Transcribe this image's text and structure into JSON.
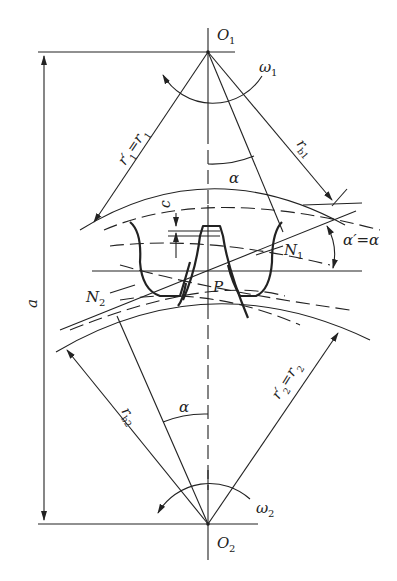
{
  "diagram": {
    "type": "gear-mesh-geometry",
    "labels": {
      "center_top": "O",
      "center_top_sub": "1",
      "center_bottom": "O",
      "center_bottom_sub": "2",
      "omega1": "ω",
      "omega1_sub": "1",
      "omega2": "ω",
      "omega2_sub": "2",
      "pitch_point": "P",
      "center_distance": "a",
      "clearance": "c",
      "n1": "N",
      "n1_sub": "1",
      "n2": "N",
      "n2_sub": "2",
      "alpha_top": "α",
      "alpha_bottom": "α",
      "pressure_angle": "α′=α",
      "r1": "r′",
      "r1_sub": "1",
      "r1_eq": "=r",
      "r1_eq_sub": "1",
      "rb1": "r",
      "rb1_sub": "b1",
      "r2": "r′",
      "r2_sub": "2",
      "r2_eq": "=r",
      "r2_eq_sub": "2",
      "rb2": "r",
      "rb2_sub": "b2"
    },
    "colors": {
      "line": "#222222",
      "background": "#ffffff"
    }
  }
}
